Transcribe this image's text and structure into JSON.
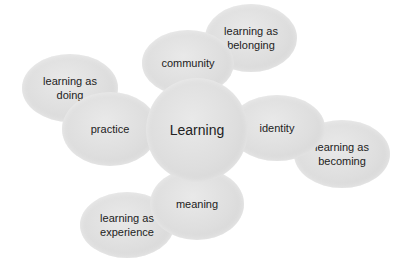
{
  "diagram": {
    "center": {
      "label": "Learning",
      "cx": 197,
      "cy": 130,
      "rx": 51,
      "ry": 52
    },
    "nodes": [
      {
        "id": "doing",
        "label": "learning as\ndoing",
        "cx": 70,
        "cy": 88,
        "rx": 48,
        "ry": 34,
        "z": 1
      },
      {
        "id": "belonging",
        "label": "learning as\nbelonging",
        "cx": 251,
        "cy": 38,
        "rx": 46,
        "ry": 34,
        "z": 1
      },
      {
        "id": "becoming",
        "label": "learning as\nbecoming",
        "cx": 342,
        "cy": 154,
        "rx": 48,
        "ry": 34,
        "z": 1
      },
      {
        "id": "experience",
        "label": "learning as\nexperience",
        "cx": 127,
        "cy": 225,
        "rx": 47,
        "ry": 33,
        "z": 1
      },
      {
        "id": "community",
        "label": "community",
        "cx": 188,
        "cy": 63,
        "rx": 46,
        "ry": 33,
        "z": 2
      },
      {
        "id": "practice",
        "label": "practice",
        "cx": 110,
        "cy": 129,
        "rx": 48,
        "ry": 37,
        "z": 2
      },
      {
        "id": "identity",
        "label": "identity",
        "cx": 277,
        "cy": 128,
        "rx": 48,
        "ry": 33,
        "z": 2
      },
      {
        "id": "meaning",
        "label": "meaning",
        "cx": 197,
        "cy": 204,
        "rx": 47,
        "ry": 36,
        "z": 2
      }
    ]
  }
}
